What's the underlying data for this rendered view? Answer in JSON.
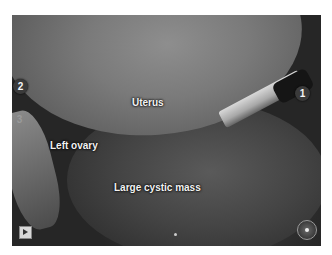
{
  "video": {
    "labels": {
      "uterus": "Uterus",
      "left_ovary": "Left ovary",
      "large_cystic_mass": "Large cystic mass"
    },
    "markers": [
      {
        "id": "1",
        "label": "1"
      },
      {
        "id": "2",
        "label": "2"
      },
      {
        "id": "3",
        "label": "3"
      }
    ],
    "controls": {
      "play_icon": "play-icon",
      "record_icon": "record-icon"
    }
  }
}
